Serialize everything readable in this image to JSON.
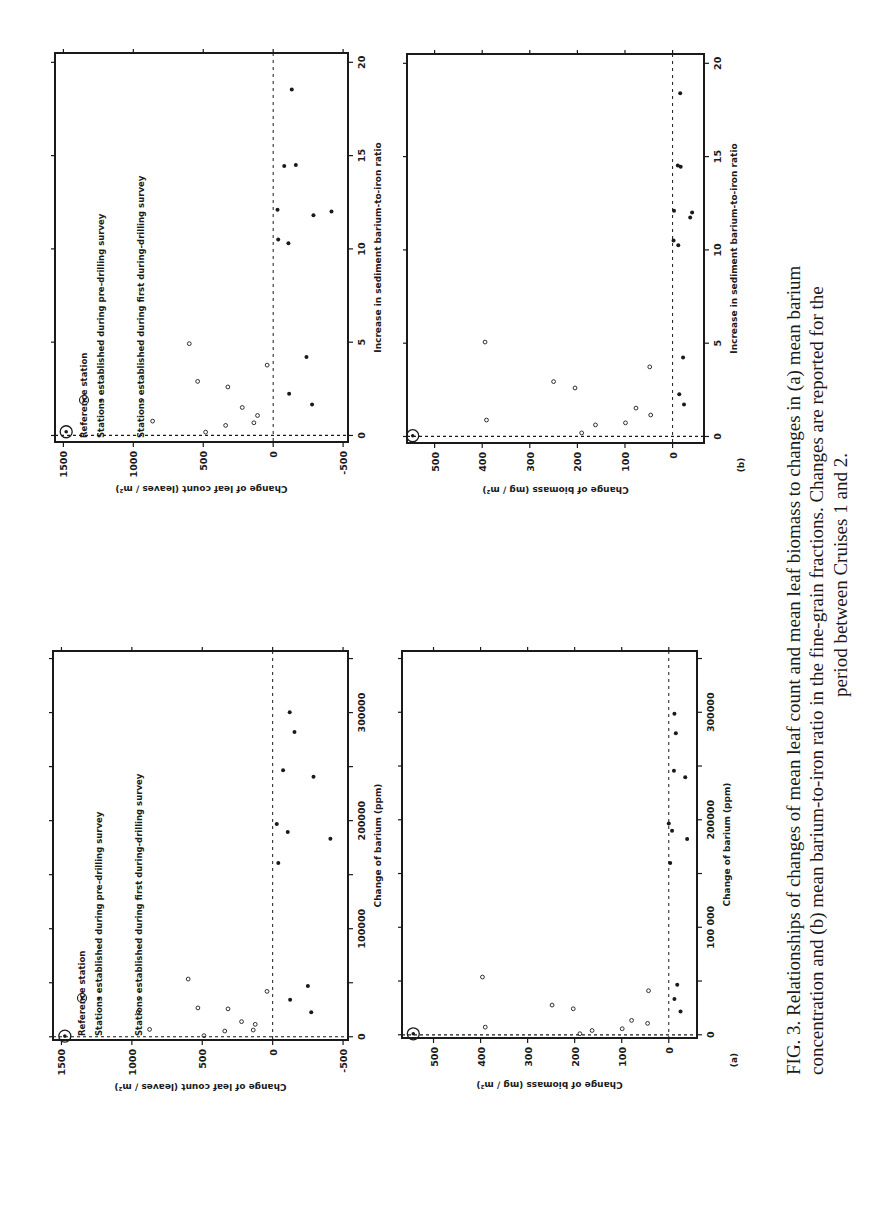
{
  "caption": {
    "lines": [
      "FIG. 3. Relationships of changes of mean leaf count and mean leaf biomass to changes in (a) mean barium",
      "concentration and (b) mean barium-to-iron ratio in the fine-grain fractions. Changes are reported for the",
      "period between Cruises 1 and 2."
    ]
  },
  "legend": {
    "reference": "Reference station",
    "pre_drilling": "Stations established during pre-drilling survey",
    "during_drilling": "Stations established during first during-drilling survey"
  },
  "chart_data": [
    {
      "id": "leaf-vs-ratio",
      "type": "scatter",
      "panel": "",
      "xlabel": "Increase in sediment barium-to-iron ratio",
      "ylabel": "Change of leaf count  (leaves / m²)",
      "xlim": [
        -0.35,
        20.5
      ],
      "ylim": [
        -535,
        1560
      ],
      "xticks": [
        0,
        5,
        10,
        15,
        20
      ],
      "xtick_labels": [
        "0",
        "5",
        "10",
        "15",
        "20"
      ],
      "yticks": [
        1500,
        1000,
        500,
        0,
        -500
      ],
      "ytick_labels": [
        "1500",
        "1000",
        "500",
        "0",
        "-500"
      ],
      "has_legend": true,
      "reference_lines": {
        "x": 0,
        "y": 0,
        "style": "dashed"
      },
      "series": [
        {
          "name": "Reference station",
          "marker": "circled-dot",
          "points": [
            [
              0.2,
              1480
            ]
          ]
        },
        {
          "name": "Stations established during pre-drilling survey",
          "marker": "filled",
          "points": [
            [
              2.24,
              -114
            ],
            [
              1.66,
              -278
            ],
            [
              4.2,
              -238
            ],
            [
              10.5,
              -36
            ],
            [
              10.3,
              -109
            ],
            [
              12.1,
              -31
            ],
            [
              11.8,
              -288
            ],
            [
              12.0,
              -417
            ],
            [
              14.45,
              -79
            ],
            [
              14.5,
              -162
            ],
            [
              18.55,
              -133
            ]
          ]
        },
        {
          "name": "Stations established during first during-drilling survey",
          "marker": "open",
          "points": [
            [
              0.18,
              483
            ],
            [
              0.77,
              862
            ],
            [
              0.54,
              340
            ],
            [
              0.68,
              138
            ],
            [
              1.07,
              112
            ],
            [
              1.5,
              221
            ],
            [
              2.6,
              324
            ],
            [
              2.9,
              540
            ],
            [
              3.77,
              43
            ],
            [
              4.92,
              600
            ]
          ]
        }
      ]
    },
    {
      "id": "biomass-vs-ratio",
      "type": "scatter",
      "panel": "(b)",
      "xlabel": "Increase in sediment  barium-to-iron ratio",
      "ylabel": "Change of biomass  (mg / m²)",
      "xlim": [
        -0.35,
        20.5
      ],
      "ylim": [
        -66,
        558
      ],
      "xticks": [
        0,
        5,
        10,
        15,
        20
      ],
      "xtick_labels": [
        "0",
        "5",
        "10",
        "15",
        "20"
      ],
      "yticks": [
        500,
        400,
        300,
        200,
        100,
        0
      ],
      "ytick_labels": [
        "500",
        "400",
        "300",
        "200",
        "100",
        "0"
      ],
      "has_legend": false,
      "reference_lines": {
        "x": 0,
        "y": 0,
        "style": "dashed"
      },
      "series": [
        {
          "name": "Reference station",
          "marker": "circled-dot",
          "points": [
            [
              0.04,
              546
            ]
          ]
        },
        {
          "name": "Stations established during pre-drilling survey",
          "marker": "filled",
          "points": [
            [
              2.26,
              -14
            ],
            [
              1.72,
              -24
            ],
            [
              4.23,
              -22
            ],
            [
              10.5,
              -2
            ],
            [
              10.25,
              -12
            ],
            [
              12.1,
              -3
            ],
            [
              11.74,
              -37
            ],
            [
              12.0,
              -41
            ],
            [
              14.53,
              -11
            ],
            [
              14.46,
              -17
            ],
            [
              18.4,
              -16
            ]
          ]
        },
        {
          "name": "Stations established during first during-drilling survey",
          "marker": "open",
          "points": [
            [
              0.19,
              191
            ],
            [
              0.88,
              391
            ],
            [
              0.62,
              162
            ],
            [
              0.73,
              99
            ],
            [
              1.52,
              77
            ],
            [
              1.15,
              46
            ],
            [
              2.6,
              205
            ],
            [
              2.94,
              250
            ],
            [
              3.73,
              48
            ],
            [
              5.06,
              394
            ]
          ]
        }
      ]
    },
    {
      "id": "leaf-vs-barium",
      "type": "scatter",
      "panel": "",
      "xlabel": "Change  of  barium (ppm)",
      "ylabel": "Change of leaf count  (leaves / m²)",
      "xlim": [
        -3000,
        357000
      ],
      "ylim": [
        -535,
        1560
      ],
      "xticks": [
        0,
        50000,
        100000,
        150000,
        200000,
        250000,
        300000,
        350000
      ],
      "xtick_labels": [
        "0",
        "",
        "100000",
        "",
        "200000",
        "",
        "300000",
        ""
      ],
      "yticks": [
        1500,
        1000,
        500,
        0,
        -500
      ],
      "ytick_labels": [
        "1500",
        "1000",
        "500",
        "0",
        "-500"
      ],
      "has_legend": true,
      "reference_lines": {
        "x": 0,
        "y": 0,
        "style": "dashed"
      },
      "series": [
        {
          "name": "Reference station",
          "marker": "circled-dot",
          "points": [
            [
              600,
              1476
            ]
          ]
        },
        {
          "name": "Stations established during pre-drilling survey",
          "marker": "filled",
          "points": [
            [
              34200,
              -124
            ],
            [
              22700,
              -274
            ],
            [
              46900,
              -250
            ],
            [
              160900,
              -40
            ],
            [
              196900,
              -29
            ],
            [
              189400,
              -107
            ],
            [
              183200,
              -410
            ],
            [
              246600,
              -74
            ],
            [
              240700,
              -290
            ],
            [
              282000,
              -155
            ],
            [
              300300,
              -121
            ]
          ]
        },
        {
          "name": "Stations established during first during-drilling survey",
          "marker": "open",
          "points": [
            [
              1000,
              488
            ],
            [
              6800,
              874
            ],
            [
              5300,
              340
            ],
            [
              6200,
              138
            ],
            [
              11500,
              124
            ],
            [
              14000,
              221
            ],
            [
              25800,
              317
            ],
            [
              26700,
              531
            ],
            [
              23000,
              955
            ],
            [
              42000,
              40
            ],
            [
              53400,
              600
            ]
          ]
        }
      ]
    },
    {
      "id": "biomass-vs-barium",
      "type": "scatter",
      "panel": "(a)",
      "xlabel": "Change  of  barium  (ppm)",
      "ylabel": "Change of biomass  (mg / m²)",
      "xlim": [
        -3000,
        357000
      ],
      "ylim": [
        -60,
        567
      ],
      "xticks": [
        0,
        50000,
        100000,
        150000,
        200000,
        250000,
        300000,
        350000
      ],
      "xtick_labels": [
        "0",
        "",
        "100 000",
        "",
        "200000",
        "",
        "300000",
        ""
      ],
      "yticks": [
        500,
        400,
        300,
        200,
        100,
        0
      ],
      "ytick_labels": [
        "500",
        "400",
        "300",
        "200",
        "100",
        "0"
      ],
      "has_legend": false,
      "reference_lines": {
        "x": 0,
        "y": 0,
        "style": "dashed"
      },
      "series": [
        {
          "name": "Reference station",
          "marker": "circled-dot",
          "points": [
            [
              900,
              543
            ]
          ]
        },
        {
          "name": "Stations established during pre-drilling survey",
          "marker": "filled",
          "points": [
            [
              33200,
              -12
            ],
            [
              21700,
              -25
            ],
            [
              46500,
              -18
            ],
            [
              159900,
              -3
            ],
            [
              196500,
              0
            ],
            [
              189700,
              -7
            ],
            [
              182200,
              -39
            ],
            [
              245500,
              -11
            ],
            [
              239600,
              -35
            ],
            [
              280600,
              -15
            ],
            [
              298600,
              -12
            ]
          ]
        },
        {
          "name": "Stations established during first during-drilling survey",
          "marker": "open",
          "points": [
            [
              1000,
              189
            ],
            [
              7100,
              390
            ],
            [
              4000,
              163
            ],
            [
              5600,
              99
            ],
            [
              13400,
              79
            ],
            [
              10600,
              45
            ],
            [
              24200,
              203
            ],
            [
              27600,
              248
            ],
            [
              41000,
              43
            ],
            [
              53700,
              396
            ]
          ]
        }
      ]
    }
  ]
}
